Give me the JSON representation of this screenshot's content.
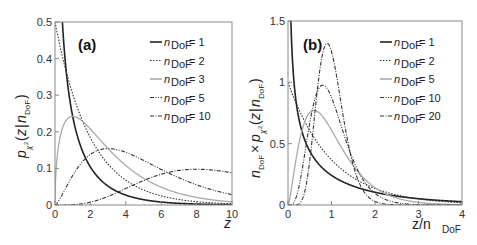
{
  "chart_data": [
    {
      "type": "line",
      "panel_label": "(a)",
      "title": "",
      "xlabel": "z",
      "ylabel": "p_{χ²}(z|n_DoF)",
      "xlim": [
        0,
        10
      ],
      "ylim": [
        0,
        0.5
      ],
      "xticks": [
        "0",
        "2",
        "4",
        "6",
        "8",
        "10"
      ],
      "yticks": [
        "0",
        "0.1",
        "0.2",
        "0.3",
        "0.4",
        "0.5"
      ],
      "grid": false,
      "legend_position": "upper right",
      "function": "chi-squared pdf p(z|n) = z^(n/2-1) e^(-z/2) / (2^(n/2) Γ(n/2))",
      "series": [
        {
          "name": "n_DoF = 1",
          "dof": 1,
          "style": "solid",
          "color": "#222222",
          "peak": {
            "x": 0,
            "y": "∞"
          }
        },
        {
          "name": "n_DoF = 2",
          "dof": 2,
          "style": "dotted",
          "color": "#333333",
          "peak": {
            "x": 0,
            "y": 0.5
          }
        },
        {
          "name": "n_DoF = 3",
          "dof": 3,
          "style": "solid",
          "color": "#aaaaaa",
          "peak": {
            "x": 1,
            "y": 0.242
          }
        },
        {
          "name": "n_DoF = 5",
          "dof": 5,
          "style": "dash-dot-dot",
          "color": "#333333",
          "peak": {
            "x": 3,
            "y": 0.154
          }
        },
        {
          "name": "n_DoF = 10",
          "dof": 10,
          "style": "dash-dot",
          "color": "#333333",
          "peak": {
            "x": 8,
            "y": 0.098
          }
        }
      ]
    },
    {
      "type": "line",
      "panel_label": "(b)",
      "title": "",
      "xlabel": "z/n_DoF",
      "ylabel": "n_DoF × p_{χ²}(z|n_DoF)",
      "xlim": [
        0,
        4
      ],
      "ylim": [
        0,
        1.5
      ],
      "xticks": [
        "0",
        "1",
        "2",
        "3",
        "4"
      ],
      "yticks": [
        "0",
        "0.5",
        "1",
        "1.5"
      ],
      "grid": false,
      "legend_position": "upper right",
      "function": "n · p(n·x | n) plotted against x = z/n",
      "series": [
        {
          "name": "n_DoF = 1",
          "dof": 1,
          "style": "solid",
          "color": "#222222"
        },
        {
          "name": "n_DoF = 2",
          "dof": 2,
          "style": "dotted",
          "color": "#333333",
          "peak": {
            "x": 0,
            "y": 1.0
          }
        },
        {
          "name": "n_DoF = 5",
          "dof": 5,
          "style": "solid",
          "color": "#aaaaaa",
          "peak": {
            "x": 0.6,
            "y": 0.77
          }
        },
        {
          "name": "n_DoF = 10",
          "dof": 10,
          "style": "dash-dot-dot",
          "color": "#333333",
          "peak": {
            "x": 0.8,
            "y": 0.98
          }
        },
        {
          "name": "n_DoF = 20",
          "dof": 20,
          "style": "dash-dot",
          "color": "#333333",
          "peak": {
            "x": 0.9,
            "y": 1.31
          }
        }
      ]
    }
  ],
  "legend_prefix": "n",
  "legend_subscript": "DoF",
  "panels": {
    "a": {
      "label": "(a)",
      "xlabel": "z",
      "legend": [
        "= 1",
        "= 2",
        "= 3",
        "= 5",
        "= 10"
      ]
    },
    "b": {
      "label": "(b)",
      "xlabel_main": "z/n",
      "xlabel_sub": "DoF",
      "legend": [
        "= 1",
        "= 2",
        "= 5",
        "= 10",
        "= 20"
      ]
    }
  }
}
